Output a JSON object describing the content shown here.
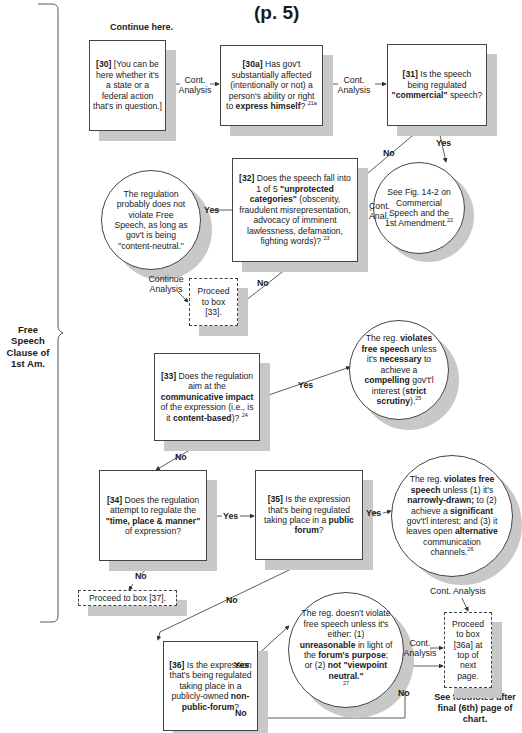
{
  "page": {
    "title": "(p. 5)",
    "continue_here": "Continue here.",
    "side_label": "Free Speech Clause of 1st Am.",
    "side_label_lines": [
      "Free Speech",
      "Clause of",
      "1st Am."
    ],
    "footnote_lines": [
      "See footnotes after",
      "final (6th) page of",
      "chart."
    ]
  },
  "nodes": {
    "b30": {
      "num": "[30]",
      "text": "[You can be here whether it's a state or a federal action that's in question.]"
    },
    "b30a": {
      "num": "[30a]",
      "pre": "Has gov't substantially affected (intentionally or not) a person's ability or right to",
      "bold": "express himself",
      "post": "?",
      "sup": "21a"
    },
    "b31": {
      "num": "[31]",
      "pre": "Is the speech being regulated",
      "bold": "\"commercial\"",
      "post": "speech?"
    },
    "c_fig": {
      "text": "See Fig. 14-2 on Commercial Speech and the 1st Amendment.",
      "sup": "22"
    },
    "b32": {
      "num": "[32]",
      "pre": "Does the speech fall into 1 of 5",
      "bold": "\"unprotected categories\"",
      "post": "(obscenity, fraudulent misrepresentation, advocacy of imminent lawlessness, defamation, fighting words)?",
      "sup": "23"
    },
    "c_neutral": {
      "text": "The regulation probably does not violate Free Speech, as long as gov't is being \"content-neutral.\""
    },
    "p33": {
      "text": "Proceed to box [33]."
    },
    "b33": {
      "num": "[33]",
      "pre": "Does the regulation aim at the",
      "bold1": "communicative impact",
      "mid": "of the expression (i.e., is it",
      "bold2": "content-based",
      "post": ")?",
      "sup": "24"
    },
    "c_strict": {
      "t1": "The reg.",
      "b1": "violates free speech",
      "t2": "unless it's",
      "b2": "necessary",
      "t3": "to achieve a",
      "b3": "compelling",
      "t4": "gov't'l interest (",
      "b4": "strict scrutiny",
      "t5": ").",
      "sup": "25"
    },
    "b34": {
      "num": "[34]",
      "pre": "Does the regulation attempt to regulate the",
      "bold": "\"time, place & manner\"",
      "post": "of expression?"
    },
    "b35": {
      "num": "[35]",
      "pre": "Is the expression that's being regulated taking place in a",
      "bold": "public forum",
      "post": "?"
    },
    "c_tpm": {
      "t1": "The reg.",
      "b1": "violates free speech",
      "t2": "unless (1) it's",
      "b2": "narrowly-drawn;",
      "t3": "to (2) achieve a",
      "b3": "significant",
      "t4": "gov't'l interest; and (3) it leaves open",
      "b4": "alternative",
      "t5": "communication channels.",
      "sup": "26"
    },
    "p37": {
      "text": "Proceed to box [37]."
    },
    "c_nonpublic": {
      "t1": "The reg. doesn't violate free speech unless it's either: (1)",
      "b1": "unreasonable",
      "t2": "in light of the",
      "b2": "forum's purpose",
      "t3": "; or (2)",
      "b3": "not \"viewpoint neutral.\"",
      "sup": "27"
    },
    "b36": {
      "num": "[36]",
      "pre": "Is the expression that's being regulated taking place in a publicly-owned",
      "bold": "non-public-forum",
      "post": "?"
    },
    "p36a": {
      "text": "Proceed to box [36a] at top of next page."
    }
  },
  "edges": {
    "e30_30a": "Cont. Analysis",
    "e30a_31": "Cont. Analysis",
    "e31_no": "No",
    "e31_yes": "Yes",
    "efig_32": "Cont. Anal.",
    "e32_yes": "Yes",
    "e32_no": "No",
    "eneutral_p33": "Continue Analysis",
    "e33_yes": "Yes",
    "e33_no": "No",
    "e34_yes": "Yes",
    "e34_no": "No",
    "e35_yes": "Yes",
    "e35_no": "No",
    "etpm_p36a": "Cont. Analysis",
    "e36_yes": "Yes",
    "e36_no": "No",
    "enonpublic_p36a": "Cont. Analysis"
  },
  "colors": {
    "shadow": "#c8c8c8",
    "border": "#444444",
    "text": "#1a1a1a"
  }
}
